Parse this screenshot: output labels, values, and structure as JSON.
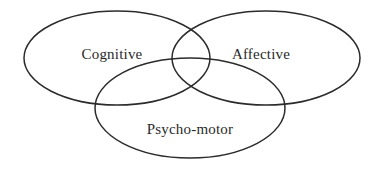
{
  "diagram": {
    "type": "venn",
    "title": "",
    "background_color": "#ffffff",
    "stroke_color": "#2b2b2b",
    "text_color": "#2a2a2a",
    "sets": [
      {
        "id": "cognitive",
        "label": "Cognitive",
        "label_x": 112,
        "label_y": 56,
        "cx": 117,
        "cy": 58,
        "rx": 93,
        "ry": 47
      },
      {
        "id": "affective",
        "label": "Affective",
        "label_x": 261,
        "label_y": 56,
        "cx": 266,
        "cy": 58,
        "rx": 94,
        "ry": 47
      },
      {
        "id": "psycho-motor",
        "label": "Psycho-motor",
        "label_x": 190,
        "label_y": 131,
        "cx": 190,
        "cy": 108,
        "rx": 95,
        "ry": 50
      }
    ]
  }
}
